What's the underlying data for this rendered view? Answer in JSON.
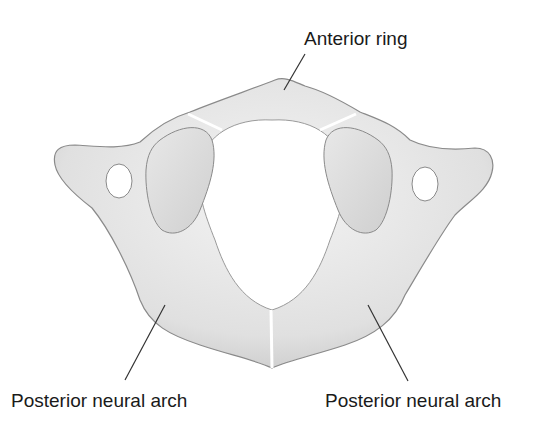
{
  "diagram": {
    "labels": {
      "anterior_ring": "Anterior ring",
      "posterior_left": "Posterior neural arch",
      "posterior_right": "Posterior neural arch"
    },
    "colors": {
      "bone_fill": "#e6e6e6",
      "bone_shadow": "#bdbdbd",
      "outline": "#8a8a8a",
      "leader_line": "#333333",
      "text": "#1a1a1a",
      "background": "#ffffff"
    }
  }
}
